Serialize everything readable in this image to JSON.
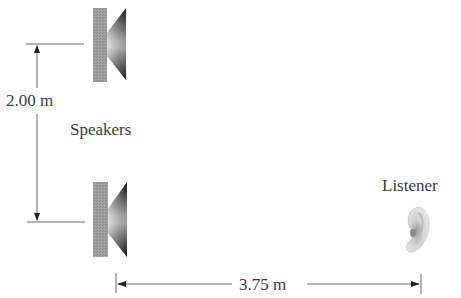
{
  "diagram": {
    "vertical_dimension": {
      "label": "2.00 m",
      "value": 2.0,
      "unit": "m"
    },
    "horizontal_dimension": {
      "label": "3.75 m",
      "value": 3.75,
      "unit": "m"
    },
    "speakers_label": "Speakers",
    "listener_label": "Listener",
    "speakers": [
      {
        "id": "top-speaker",
        "position": "top"
      },
      {
        "id": "bottom-speaker",
        "position": "bottom"
      }
    ],
    "listener": {
      "icon": "ear-icon"
    },
    "colors": {
      "line": "#555555",
      "speaker_box": "#9a9a9a",
      "cone_dark": "#2a2a2a",
      "cone_light": "#d8d8d8",
      "ear": "#cfcfcf"
    }
  }
}
